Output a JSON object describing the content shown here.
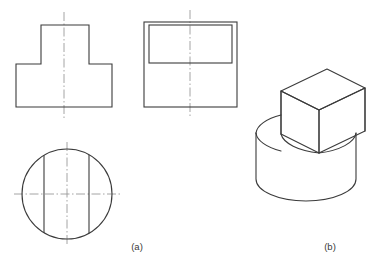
{
  "figure": {
    "background_color": "#ffffff",
    "line_color": "#3b3b3b",
    "centerline_color": "#9a9a9a",
    "line_width": 1.1,
    "captions": [
      {
        "id": "caption-a",
        "label": "(a)",
        "x": 137,
        "y": 250,
        "describes": "three-view orthographic projection"
      },
      {
        "id": "caption-b",
        "label": "(b)",
        "x": 330,
        "y": 250,
        "describes": "isometric pictorial view"
      }
    ]
  },
  "views": {
    "front_view": {
      "name": "T-shaped front view",
      "outline_points": "16,107 16,64 41,64 41,25 89,25 89,64 112,64 112,107",
      "bounds": {
        "x1": 16,
        "y1": 25,
        "x2": 112,
        "y2": 107
      },
      "upper_block": {
        "x1": 41,
        "y1": 25,
        "x2": 89,
        "y2": 64
      },
      "lower_block": {
        "x1": 16,
        "y1": 64,
        "x2": 112,
        "y2": 107
      },
      "centerline": {
        "x": 64,
        "y1": 12,
        "y2": 118
      }
    },
    "side_view": {
      "name": "Side view with rectangular slab outline",
      "outer_rect": {
        "x1": 144,
        "y1": 22,
        "x2": 237,
        "y2": 107
      },
      "inner_rect": {
        "x1": 149,
        "y1": 25,
        "x2": 232,
        "y2": 63
      },
      "centerline": {
        "x": 190,
        "y1": 10,
        "y2": 118
      }
    },
    "top_view": {
      "name": "Top view circle with two chords",
      "circle": {
        "cx": 67,
        "cy": 194,
        "r": 45
      },
      "chord_left": {
        "x": 44,
        "y1": 155,
        "y2": 233
      },
      "chord_right": {
        "x": 89,
        "y1": 155,
        "y2": 233
      },
      "centerline_vertical": {
        "x": 67,
        "y1": 142,
        "y2": 246
      },
      "centerline_horizontal": {
        "y": 194,
        "x1": 14,
        "x2": 120
      }
    },
    "isometric_view": {
      "name": "Isometric pictorial of cylinder with rectangular slab",
      "cylinder": {
        "top_ellipse_cx": 306,
        "top_ellipse_cy": 133,
        "top_ellipse_rx": 50,
        "top_ellipse_ry": 22,
        "bottom_ellipse_cy": 179,
        "body_height": 46
      },
      "slab": {
        "description": "rectangular prism sitting on the cylinder top, flush front and back faces",
        "top_face": "281,91 327,69 365,88 319,110",
        "front_face": "281,91 319,110 319,153 281,134",
        "right_face": "319,110 365,88 365,131 319,153"
      }
    }
  }
}
